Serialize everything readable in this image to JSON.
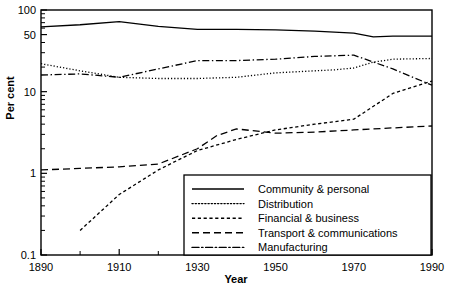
{
  "chart_data": {
    "type": "line",
    "title": "",
    "xlabel": "Year",
    "ylabel": "Per cent",
    "yscale": "log",
    "ylim": [
      0.1,
      100
    ],
    "xlim": [
      1890,
      1990
    ],
    "grid": false,
    "legend_position": "bottom-right",
    "y_ticks": [
      "0.1",
      "1",
      "10",
      "50",
      "100"
    ],
    "y_tick_values": [
      0.1,
      1,
      10,
      50,
      100
    ],
    "x_ticks": [
      "1890",
      "1910",
      "1930",
      "1950",
      "1970",
      "1990"
    ],
    "x_tick_values": [
      1890,
      1910,
      1930,
      1950,
      1970,
      1990
    ],
    "x_minor_ticks": [
      1900,
      1920,
      1940,
      1960,
      1980
    ],
    "series": [
      {
        "name": "Community & personal",
        "style": "solid",
        "x": [
          1890,
          1900,
          1910,
          1920,
          1930,
          1940,
          1950,
          1960,
          1970,
          1975,
          1980,
          1990
        ],
        "values": [
          62,
          66,
          72,
          63,
          58,
          58,
          57,
          55,
          52,
          47,
          48,
          48
        ]
      },
      {
        "name": "Distribution",
        "style": "dotted",
        "x": [
          1890,
          1900,
          1910,
          1920,
          1930,
          1940,
          1950,
          1960,
          1965,
          1970,
          1975,
          1980,
          1990
        ],
        "values": [
          22,
          18,
          15,
          14.5,
          14.5,
          15,
          17,
          18,
          18.5,
          19.5,
          23,
          25,
          25.5
        ]
      },
      {
        "name": "Financial & business",
        "style": "dashed-fine",
        "x": [
          1900,
          1910,
          1920,
          1925,
          1930,
          1940,
          1950,
          1960,
          1970,
          1980,
          1990
        ],
        "values": [
          0.2,
          0.55,
          1.1,
          1.45,
          1.9,
          2.6,
          3.4,
          4.0,
          4.6,
          9.5,
          13.5
        ]
      },
      {
        "name": "Transport & communications",
        "style": "dashed",
        "x": [
          1890,
          1900,
          1910,
          1920,
          1930,
          1935,
          1940,
          1950,
          1960,
          1970,
          1980,
          1990
        ],
        "values": [
          1.1,
          1.15,
          1.2,
          1.3,
          2.0,
          2.9,
          3.5,
          3.1,
          3.2,
          3.4,
          3.6,
          3.8
        ]
      },
      {
        "name": "Manufacturing",
        "style": "dash-dot",
        "x": [
          1890,
          1900,
          1910,
          1920,
          1930,
          1940,
          1950,
          1960,
          1970,
          1980,
          1990
        ],
        "values": [
          16,
          16.5,
          15,
          19,
          24,
          24,
          25,
          27,
          28,
          19,
          12
        ]
      }
    ]
  },
  "legend": {
    "items": [
      {
        "label": "Community & personal",
        "style": "solid"
      },
      {
        "label": "Distribution",
        "style": "dotted"
      },
      {
        "label": "Financial & business",
        "style": "dashed-fine"
      },
      {
        "label": "Transport & communications",
        "style": "dashed"
      },
      {
        "label": "Manufacturing",
        "style": "dash-dot"
      }
    ]
  }
}
